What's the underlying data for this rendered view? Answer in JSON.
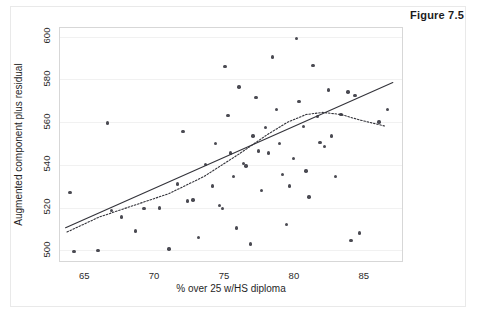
{
  "figure": {
    "label": "Figure 7.5"
  },
  "chart_data": {
    "type": "scatter",
    "title": "",
    "xlabel": "% over 25 w/HS diploma",
    "ylabel": "Augmented component plus residual",
    "xlim": [
      63.2,
      87.8
    ],
    "ylim": [
      494,
      604
    ],
    "xticks": [
      65,
      70,
      75,
      80,
      85
    ],
    "yticks": [
      500,
      520,
      540,
      560,
      580,
      600
    ],
    "xtick_labels": [
      "65",
      "70",
      "75",
      "80",
      "85"
    ],
    "ytick_labels": [
      "500",
      "520",
      "540",
      "560",
      "580",
      "600"
    ],
    "grid": true,
    "grid_axis": "y",
    "legend": "none",
    "marker": {
      "shape": "circle",
      "color": "#4a4a52",
      "size": 3.4
    },
    "points": [
      {
        "x": 63.9,
        "y": 527.0
      },
      {
        "x": 64.2,
        "y": 499.5
      },
      {
        "x": 65.9,
        "y": 499.8
      },
      {
        "x": 66.6,
        "y": 559.5
      },
      {
        "x": 66.9,
        "y": 518.5
      },
      {
        "x": 67.6,
        "y": 515.5
      },
      {
        "x": 68.6,
        "y": 509.0
      },
      {
        "x": 69.2,
        "y": 519.5
      },
      {
        "x": 70.3,
        "y": 519.8
      },
      {
        "x": 71.0,
        "y": 500.5
      },
      {
        "x": 71.6,
        "y": 531.0
      },
      {
        "x": 72.0,
        "y": 555.5
      },
      {
        "x": 72.3,
        "y": 523.0
      },
      {
        "x": 72.7,
        "y": 523.5
      },
      {
        "x": 73.1,
        "y": 506.0
      },
      {
        "x": 73.6,
        "y": 540.0
      },
      {
        "x": 74.1,
        "y": 530.0
      },
      {
        "x": 74.3,
        "y": 550.0
      },
      {
        "x": 74.6,
        "y": 521.0
      },
      {
        "x": 74.8,
        "y": 519.5
      },
      {
        "x": 75.0,
        "y": 586.0
      },
      {
        "x": 75.2,
        "y": 563.0
      },
      {
        "x": 75.4,
        "y": 545.5
      },
      {
        "x": 75.6,
        "y": 534.5
      },
      {
        "x": 75.8,
        "y": 510.5
      },
      {
        "x": 76.0,
        "y": 576.5
      },
      {
        "x": 76.3,
        "y": 540.5
      },
      {
        "x": 76.5,
        "y": 539.5
      },
      {
        "x": 76.8,
        "y": 503.0
      },
      {
        "x": 77.0,
        "y": 553.5
      },
      {
        "x": 77.2,
        "y": 571.5
      },
      {
        "x": 77.4,
        "y": 546.5
      },
      {
        "x": 77.6,
        "y": 528.0
      },
      {
        "x": 77.9,
        "y": 557.5
      },
      {
        "x": 78.1,
        "y": 545.5
      },
      {
        "x": 78.4,
        "y": 590.5
      },
      {
        "x": 78.7,
        "y": 566.0
      },
      {
        "x": 78.9,
        "y": 550.0
      },
      {
        "x": 79.1,
        "y": 535.5
      },
      {
        "x": 79.4,
        "y": 512.0
      },
      {
        "x": 79.6,
        "y": 530.0
      },
      {
        "x": 79.9,
        "y": 543.0
      },
      {
        "x": 80.1,
        "y": 599.0
      },
      {
        "x": 80.3,
        "y": 569.5
      },
      {
        "x": 80.6,
        "y": 558.0
      },
      {
        "x": 80.8,
        "y": 537.0
      },
      {
        "x": 81.0,
        "y": 525.0
      },
      {
        "x": 81.3,
        "y": 586.5
      },
      {
        "x": 81.6,
        "y": 562.5
      },
      {
        "x": 81.8,
        "y": 550.5
      },
      {
        "x": 82.1,
        "y": 548.5
      },
      {
        "x": 82.4,
        "y": 575.0
      },
      {
        "x": 82.6,
        "y": 553.5
      },
      {
        "x": 82.9,
        "y": 534.5
      },
      {
        "x": 83.3,
        "y": 563.5
      },
      {
        "x": 83.8,
        "y": 574.0
      },
      {
        "x": 84.0,
        "y": 504.5
      },
      {
        "x": 84.3,
        "y": 572.5
      },
      {
        "x": 84.6,
        "y": 508.0
      },
      {
        "x": 86.0,
        "y": 560.0
      },
      {
        "x": 86.6,
        "y": 566.0
      }
    ],
    "series": [
      {
        "name": "linear fit",
        "type": "line",
        "style": "solid",
        "color": "#33333a",
        "points": [
          {
            "x": 63.6,
            "y": 510.5
          },
          {
            "x": 87.0,
            "y": 578.5
          }
        ]
      },
      {
        "name": "loess smooth",
        "type": "line",
        "style": "dotted",
        "color": "#33333a",
        "points": [
          {
            "x": 63.7,
            "y": 508.5
          },
          {
            "x": 66.0,
            "y": 515.5
          },
          {
            "x": 68.5,
            "y": 521.0
          },
          {
            "x": 71.0,
            "y": 526.5
          },
          {
            "x": 73.5,
            "y": 534.5
          },
          {
            "x": 76.0,
            "y": 545.0
          },
          {
            "x": 78.0,
            "y": 554.0
          },
          {
            "x": 79.5,
            "y": 560.0
          },
          {
            "x": 80.8,
            "y": 563.5
          },
          {
            "x": 82.0,
            "y": 564.5
          },
          {
            "x": 83.3,
            "y": 563.5
          },
          {
            "x": 84.6,
            "y": 561.0
          },
          {
            "x": 86.5,
            "y": 558.0
          }
        ]
      }
    ]
  }
}
